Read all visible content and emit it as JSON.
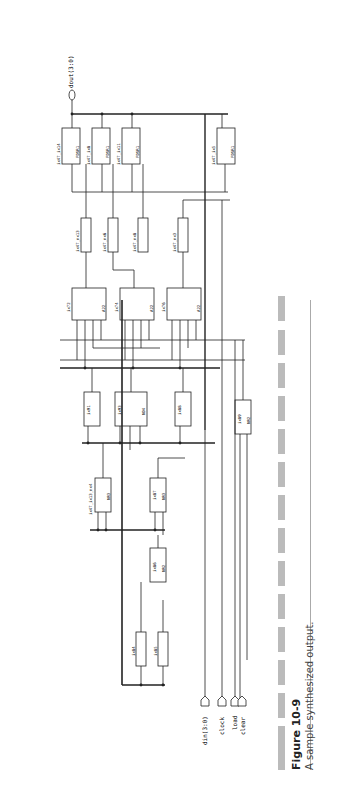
{
  "figure": {
    "number": "Figure 10-9",
    "caption": "A sample synthesized output."
  },
  "ports": {
    "output": "dout(3:0)",
    "inputs": [
      "din(3:0)",
      "clock",
      "load",
      "clear"
    ]
  },
  "flipflops": [
    {
      "name": "ix47_ix14",
      "type": "FDSR1",
      "pins": [
        "D",
        "CP",
        "Q"
      ]
    },
    {
      "name": "ix47_ix8",
      "type": "FDSR1",
      "pins": [
        "D",
        "CP",
        "Q"
      ]
    },
    {
      "name": "ix47_ix11",
      "type": "FDSR1",
      "pins": [
        "D",
        "CP",
        "Q"
      ]
    },
    {
      "name": "ix47_ix5",
      "type": "FDSR1",
      "pins": [
        "D",
        "CP",
        "Q"
      ]
    }
  ],
  "inverters_top": [
    {
      "name": "ix47_nx13",
      "type": "IVP"
    },
    {
      "name": "ix47_nx6",
      "type": "IVP"
    },
    {
      "name": "ix47_nx8",
      "type": "IVP"
    },
    {
      "name": "ix47_nx3",
      "type": "IVP"
    }
  ],
  "and_or_gates": [
    {
      "name": "ix72",
      "type": "A22"
    },
    {
      "name": "ix74",
      "type": "A22"
    },
    {
      "name": "ix76",
      "type": "A22"
    }
  ],
  "mid_gates": [
    {
      "name": "ix91",
      "type": "NR"
    },
    {
      "name": "ix93",
      "type": "ND4"
    },
    {
      "name": "ix88",
      "type": "NR"
    },
    {
      "name": "ix89",
      "type": "NR2"
    }
  ],
  "lower_gates": [
    {
      "name": "ix47_ix13_nx4",
      "type": "NR3"
    },
    {
      "name": "ix87",
      "type": "NR3"
    },
    {
      "name": "ix86",
      "type": "NR2"
    }
  ],
  "inverters_bottom": [
    {
      "name": "ix84",
      "type": "IVP"
    },
    {
      "name": "ix85",
      "type": "IVP"
    }
  ],
  "colors": {
    "wire": "#222222",
    "bus": "#111111",
    "dash_bar": "#bbbbbb",
    "rule": "#aaaaaa"
  }
}
